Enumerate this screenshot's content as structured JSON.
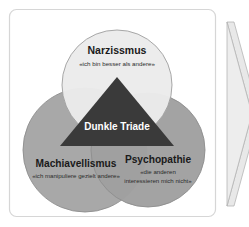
{
  "figure": {
    "title_internal": "Dunkle Triade Venn-Diagramm",
    "frame": {
      "border_color": "#d4d4d4",
      "background": "#ffffff",
      "corner_radius": 6
    },
    "center": {
      "label": "Dunkle Triade",
      "shape": "triangle",
      "fill": "#3a3a3a",
      "text_color": "#ffffff"
    },
    "circles": [
      {
        "id": "narzissmus",
        "title": "Narzissmus",
        "subtitle": "«ich bin besser als andere»",
        "fill": "#ebebeb",
        "stroke": "#9a9a9a",
        "position": "top"
      },
      {
        "id": "machiavellismus",
        "title": "Machiavellismus",
        "subtitle": "«ich manipuliere gezielt andere»",
        "fill": "#a8a8a8",
        "stroke": "#8a8a8a",
        "position": "bottom-left"
      },
      {
        "id": "psychopathie",
        "title": "Psychopathie",
        "subtitle_line1": "«die anderen",
        "subtitle_line2": "interessieren mich nicht»",
        "fill": "#a0a0a0",
        "stroke": "#8a8a8a",
        "position": "bottom-right"
      }
    ],
    "decoration": {
      "arrow_fill": "#e8e8e8",
      "arrow_stroke": "#b0b0b0",
      "arrow_name": "chevron-arrow-right"
    }
  }
}
